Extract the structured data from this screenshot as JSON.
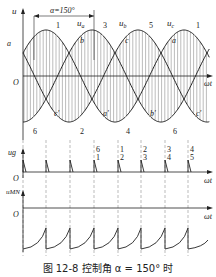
{
  "figure": {
    "caption": "图 12-8   控制角 α = 150° 时",
    "alpha_label": "α=150°",
    "alpha_degrees": 150
  },
  "panel_voltage": {
    "y_label": "u",
    "x_label": "ωt",
    "origin": "O",
    "phase_labels": [
      "ua",
      "ub",
      "uc"
    ],
    "phase_label_text": {
      "ua": "u",
      "ua_sub": "a",
      "ub": "u",
      "ub_sub": "b",
      "uc": "u",
      "uc_sub": "c"
    },
    "upper_cross_labels": [
      "a",
      "b",
      "c",
      "a"
    ],
    "lower_cross_labels": [
      "c'",
      "a'",
      "b'",
      "c'"
    ],
    "peak_numbers": [
      "1",
      "3",
      "5",
      "1"
    ],
    "trough_numbers": [
      "6",
      "2",
      "4",
      "6"
    ]
  },
  "panel_pulses": {
    "y_label": "ug",
    "x_label": "ωt",
    "origin": "O",
    "pulse_pairs": [
      [
        "6",
        "1"
      ],
      [
        "1",
        "2"
      ],
      [
        "2",
        "3"
      ],
      [
        "3",
        "4"
      ],
      [
        "4",
        "5"
      ]
    ]
  },
  "panel_umn": {
    "y_label": "uMN",
    "x_label": "ωt",
    "origin": "O"
  }
}
